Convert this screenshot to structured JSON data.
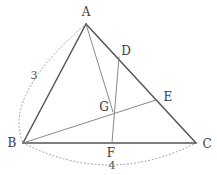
{
  "figure": {
    "width": 217,
    "height": 175,
    "background": "#ffffff",
    "stroke_color": "#555555",
    "thin_stroke_color": "#7a7a7a",
    "arc_color": "#999999",
    "label_color": "#3c3c3c",
    "measure_color": "#555555"
  },
  "points": {
    "A": {
      "label": "A",
      "x": 86,
      "y": 24,
      "label_x": 86,
      "label_y": 12
    },
    "B": {
      "label": "B",
      "x": 23,
      "y": 143,
      "label_x": 12,
      "label_y": 143
    },
    "C": {
      "label": "C",
      "x": 196,
      "y": 143,
      "label_x": 207,
      "label_y": 144
    },
    "D": {
      "label": "D",
      "x": 119,
      "y": 57,
      "label_x": 126,
      "label_y": 51
    },
    "E": {
      "label": "E",
      "x": 156,
      "y": 100,
      "label_x": 168,
      "label_y": 97
    },
    "F": {
      "label": "F",
      "x": 112,
      "y": 143,
      "label_x": 111,
      "label_y": 153
    },
    "G": {
      "label": "G",
      "x": 113,
      "y": 112,
      "label_x": 104,
      "label_y": 107
    }
  },
  "segments": [
    {
      "name": "side-AB",
      "from": "A",
      "to": "B",
      "weight": "thick"
    },
    {
      "name": "side-AC",
      "from": "A",
      "to": "C",
      "weight": "thick"
    },
    {
      "name": "side-BC",
      "from": "B",
      "to": "C",
      "weight": "thick"
    },
    {
      "name": "cevian-AG",
      "from": "A",
      "to": "G",
      "weight": "thin"
    },
    {
      "name": "cevian-DF",
      "from": "D",
      "to": "F",
      "weight": "thin"
    },
    {
      "name": "cevian-BE",
      "from": "B",
      "to": "E",
      "weight": "thin"
    }
  ],
  "arcs": [
    {
      "name": "measure-arc-AB",
      "from": "A",
      "to": "B",
      "bulge_x": -26,
      "bulge_y": 6,
      "style": "dotted"
    },
    {
      "name": "measure-arc-BC",
      "from": "B",
      "to": "C",
      "bulge_x": 0,
      "bulge_y": 22,
      "style": "dotted"
    }
  ],
  "measures": {
    "side_ab": {
      "value": "3",
      "x": 34,
      "y": 75
    },
    "side_bc": {
      "value": "4",
      "x": 112,
      "y": 165
    }
  }
}
